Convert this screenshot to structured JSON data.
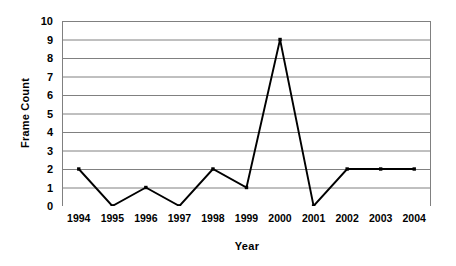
{
  "chart_data": {
    "type": "line",
    "title": "",
    "subtitle": "",
    "xlabel": "Year",
    "ylabel": "Frame Count",
    "categories": [
      "1994",
      "1995",
      "1996",
      "1997",
      "1998",
      "1999",
      "2000",
      "2001",
      "2002",
      "2003",
      "2004"
    ],
    "x": [
      1994,
      1995,
      1996,
      1997,
      1998,
      1999,
      2000,
      2001,
      2002,
      2003,
      2004
    ],
    "values": [
      2,
      0,
      1,
      0,
      2,
      1,
      9,
      0,
      2,
      2,
      2
    ],
    "series": [
      {
        "name": "Frame Count",
        "values": [
          2,
          0,
          1,
          0,
          2,
          1,
          9,
          0,
          2,
          2,
          2
        ]
      }
    ],
    "ylim": [
      0,
      10
    ],
    "yticks": [
      0,
      1,
      2,
      3,
      4,
      5,
      6,
      7,
      8,
      9,
      10
    ],
    "ytick_labels": [
      "0",
      "1",
      "2",
      "3",
      "4",
      "5",
      "6",
      "7",
      "8",
      "9",
      "10"
    ],
    "grid": true,
    "grid_axis": "y",
    "legend": false,
    "legend_position": "none",
    "annotations": [],
    "colors": {
      "line": "#000000",
      "marker": "#000000",
      "gridline": "#808080",
      "axis": "#808080",
      "background": "#ffffff",
      "text": "#000000"
    }
  }
}
